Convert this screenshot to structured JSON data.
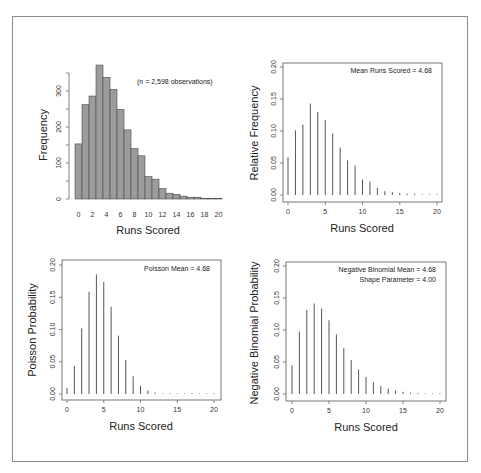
{
  "chart_data": [
    {
      "type": "bar",
      "panel": "top-left",
      "title": "",
      "xlabel": "Runs Scored",
      "ylabel": "Frequency",
      "annotation": "(n = 2,598 observations)",
      "categories": [
        0,
        1,
        2,
        3,
        4,
        5,
        6,
        7,
        8,
        9,
        10,
        11,
        12,
        13,
        14,
        15,
        16,
        17,
        18,
        19,
        20
      ],
      "values": [
        153,
        262,
        286,
        372,
        338,
        304,
        249,
        192,
        140,
        120,
        62,
        55,
        29,
        16,
        13,
        8,
        5,
        5,
        1,
        1,
        2
      ],
      "xticks": [
        "0",
        "2",
        "4",
        "6",
        "8",
        "10",
        "12",
        "14",
        "16",
        "18",
        "20"
      ],
      "yticks": [
        "0",
        "50",
        "100",
        "150",
        "200",
        "250",
        "300",
        "350"
      ],
      "ytick_labels": [
        "0",
        "",
        "100",
        "",
        "200",
        "",
        "300",
        ""
      ],
      "ylim": [
        0,
        380
      ],
      "grid": false
    },
    {
      "type": "bar",
      "style": "stem",
      "panel": "top-right",
      "xlabel": "Runs Scored",
      "ylabel": "Relative Frequency",
      "annotation": "Mean Runs Scored = 4.68",
      "x": [
        0,
        1,
        2,
        3,
        4,
        5,
        6,
        7,
        8,
        9,
        10,
        11,
        12,
        13,
        14,
        15,
        16,
        17,
        18,
        19,
        20
      ],
      "values": [
        0.059,
        0.101,
        0.11,
        0.143,
        0.13,
        0.117,
        0.096,
        0.074,
        0.054,
        0.046,
        0.024,
        0.021,
        0.011,
        0.006,
        0.005,
        0.003,
        0.002,
        0.002,
        0.0,
        0.0,
        0.001
      ],
      "xticks": [
        "0",
        "5",
        "10",
        "15",
        "20"
      ],
      "yticks": [
        "0.00",
        "0.05",
        "0.10",
        "0.15",
        "0.20"
      ],
      "ylim": [
        0,
        0.2
      ],
      "grid": false
    },
    {
      "type": "bar",
      "style": "stem",
      "panel": "bottom-left",
      "xlabel": "Runs Scored",
      "ylabel": "Poisson Probability",
      "annotation": "Poisson Mean = 4.68",
      "x": [
        0,
        1,
        2,
        3,
        4,
        5,
        6,
        7,
        8,
        9,
        10,
        11,
        12,
        13,
        14,
        15,
        16,
        17,
        18,
        19,
        20
      ],
      "values": [
        0.0093,
        0.0434,
        0.1016,
        0.1585,
        0.1855,
        0.1736,
        0.1354,
        0.0905,
        0.053,
        0.0275,
        0.0129,
        0.0055,
        0.0021,
        0.0008,
        0.0003,
        0.0001,
        0.0001,
        0.0001,
        0.0001,
        0.0001,
        0.0001
      ],
      "xticks": [
        "0",
        "5",
        "10",
        "15",
        "20"
      ],
      "yticks": [
        "0.00",
        "0.05",
        "0.10",
        "0.15",
        "0.20"
      ],
      "ylim": [
        0,
        0.2
      ],
      "grid": false
    },
    {
      "type": "bar",
      "style": "stem",
      "panel": "bottom-right",
      "xlabel": "Runs Scored",
      "ylabel": "Negative Binomial Probability",
      "annotation": [
        "Negative Binomial Mean = 4.68",
        "Shape Parameter = 4.00"
      ],
      "x": [
        0,
        1,
        2,
        3,
        4,
        5,
        6,
        7,
        8,
        9,
        10,
        11,
        12,
        13,
        14,
        15,
        16,
        17,
        18,
        19,
        20
      ],
      "values": [
        0.0451,
        0.0973,
        0.1312,
        0.1415,
        0.1335,
        0.1152,
        0.0932,
        0.0718,
        0.0532,
        0.0383,
        0.0268,
        0.0184,
        0.0124,
        0.0082,
        0.0054,
        0.0035,
        0.0022,
        0.0014,
        0.0009,
        0.0006,
        0.0004
      ],
      "xticks": [
        "0",
        "5",
        "10",
        "15",
        "20"
      ],
      "yticks": [
        "0.00",
        "0.05",
        "0.10",
        "0.15",
        "0.20"
      ],
      "ylim": [
        0,
        0.2
      ],
      "grid": false
    }
  ],
  "labels": {
    "hist_ylabel": "Frequency",
    "hist_xlabel": "Runs Scored",
    "hist_note": "(n = 2,598 observations)",
    "rel_ylabel": "Relative Frequency",
    "rel_xlabel": "Runs Scored",
    "rel_note": "Mean Runs Scored = 4.68",
    "pois_ylabel": "Poisson Probability",
    "pois_xlabel": "Runs Scored",
    "pois_note": "Poisson Mean = 4.68",
    "nb_ylabel": "Negative Binomial Probability",
    "nb_xlabel": "Runs Scored",
    "nb_note1": "Negative Binomial Mean = 4.68",
    "nb_note2": "Shape Parameter = 4.00"
  },
  "colors": {
    "bar_fill": "#9c9c9c",
    "bar_stroke": "#4a4a4a",
    "stem": "#555555",
    "axis": "#555555",
    "frame": "#8a8a8a"
  }
}
